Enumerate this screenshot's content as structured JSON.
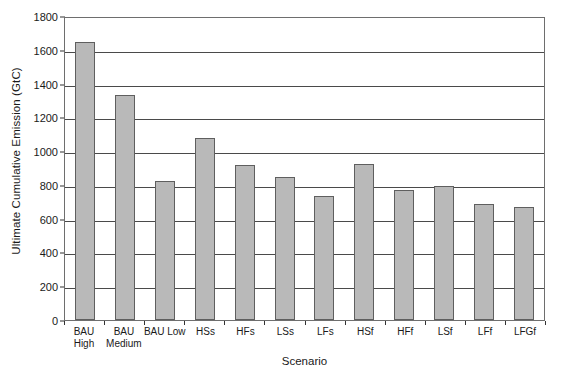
{
  "chart_data": {
    "type": "bar",
    "title": "",
    "xlabel": "Scenario",
    "ylabel": "Ultimate Cumulative Emission (GtC)",
    "categories": [
      "BAU High",
      "BAU Medium",
      "BAU Low",
      "HSs",
      "HFs",
      "LSs",
      "LFs",
      "HSf",
      "HFf",
      "LSf",
      "LFf",
      "LFGf"
    ],
    "category_lines": [
      [
        "BAU",
        "High"
      ],
      [
        "BAU",
        "Medium"
      ],
      [
        "BAU Low",
        ""
      ],
      [
        "HSs",
        ""
      ],
      [
        "HFs",
        ""
      ],
      [
        "LSs",
        ""
      ],
      [
        "LFs",
        ""
      ],
      [
        "HSf",
        ""
      ],
      [
        "HFf",
        ""
      ],
      [
        "LSf",
        ""
      ],
      [
        "LFf",
        ""
      ],
      [
        "LFGf",
        ""
      ]
    ],
    "values": [
      1645,
      1330,
      825,
      1078,
      917,
      845,
      735,
      925,
      772,
      793,
      688,
      667
    ],
    "ylim": [
      0,
      1800
    ],
    "yticks": [
      0,
      200,
      400,
      600,
      800,
      1000,
      1200,
      1400,
      1600,
      1800
    ],
    "ytick_labels": [
      "0",
      "200",
      "400",
      "600",
      "800",
      "1000",
      "1200",
      "1400",
      "1600",
      "1800"
    ],
    "grid": true,
    "legend": null,
    "bar_color": "#b9b9b9",
    "bar_border_color": "#5f5f5f",
    "axis_color": "#4a4a4a"
  }
}
